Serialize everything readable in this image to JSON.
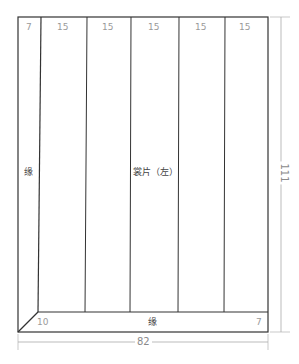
{
  "diagram": {
    "type": "sewing-pattern-panel",
    "panel_label": "裳片（左）",
    "edge_label_left": "缘",
    "edge_label_bottom": "缘",
    "column_widths": [
      "7",
      "15",
      "15",
      "15",
      "15",
      "15"
    ],
    "bottom_left_value": "10",
    "bottom_right_value": "7",
    "dimensions": {
      "width": "82",
      "height": "111"
    },
    "colors": {
      "outline": "#333333",
      "dimension_line": "#aaaaaa",
      "label": "#9a9a9a"
    }
  }
}
